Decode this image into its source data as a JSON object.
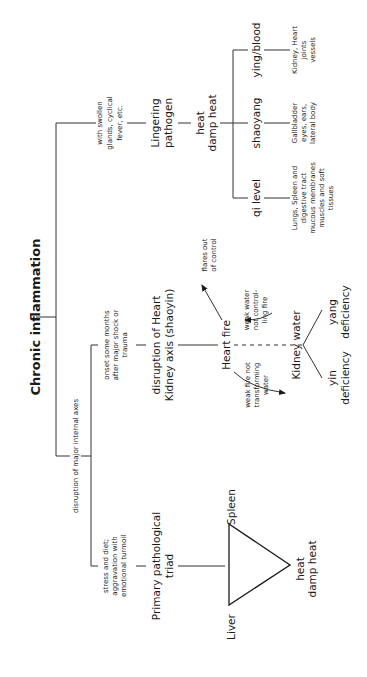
{
  "title": "Chronic inflammation",
  "branch_labels": {
    "pathogen": [
      "with swollen",
      "glands, cyclical",
      "fever, etc."
    ],
    "axes": "disruption of major internal axes",
    "heart_kidney_cause": [
      "onset some months",
      "after major shock or",
      "trauma"
    ],
    "triad_cause": [
      "stress and diet;",
      "aggravation with",
      "emotional turmoil"
    ]
  },
  "nodes": {
    "lingering_pathogen": [
      "Lingering",
      "pathogen"
    ],
    "heat_damp_heat": [
      "heat",
      "damp heat"
    ],
    "qi_level": "qi level",
    "shaoyang": "shaoyang",
    "ying_blood": "ying/blood",
    "heart_kidney_axis": [
      "disruption of Heart",
      "Kidney axis (shaoyin)"
    ],
    "heart_fire": "Heart fire",
    "kidney_water": "Kidney water",
    "yin_deficiency": [
      "yin",
      "deficiency"
    ],
    "yang_deficiency": [
      "yang",
      "deficiency"
    ],
    "primary_triad": [
      "Primary pathological",
      "triad"
    ],
    "spleen": "Spleen",
    "liver": "Liver",
    "triad_heat": [
      "heat",
      "damp heat"
    ]
  },
  "details": {
    "qi_level": [
      "Lungs, Spleen and",
      "digestive tract",
      "mucous membranes",
      "muscles and soft",
      "tissues"
    ],
    "shaoyang": [
      "Gallbladder",
      "eyes, ears,",
      "lateral body"
    ],
    "ying_blood": [
      "Kidney, Heart",
      "joints",
      "vessels"
    ]
  },
  "annotations": {
    "flares": [
      "flares out",
      "of control"
    ],
    "weak_water": [
      "weak water",
      "not control-",
      "ling fire"
    ],
    "weak_fire": [
      "weak fire not",
      "transforming",
      "water"
    ]
  }
}
